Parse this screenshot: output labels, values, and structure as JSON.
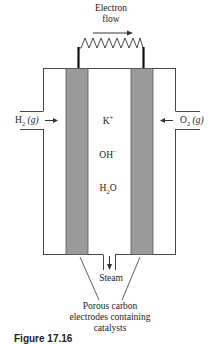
{
  "diagram": {
    "type": "alkaline_fuel_cell",
    "colors": {
      "line": "#333333",
      "electrode_fill": "#9a9a9a",
      "electrode_border": "#555555",
      "wire": "#111111",
      "background": "#ffffff"
    },
    "labels": {
      "electron_flow_line1": "Electron",
      "electron_flow_line2": "flow",
      "left_inlet": {
        "species": "H",
        "sub": "2",
        "state": "(g)"
      },
      "right_inlet": {
        "species": "O",
        "sub": "2",
        "state": "(g)"
      },
      "electrolyte": {
        "cation": {
          "base": "K",
          "sup": "+"
        },
        "anion": {
          "base": "OH",
          "sup": "−"
        },
        "water": {
          "pre": "H",
          "sub": "2",
          "post": "O"
        }
      },
      "outlet": "Steam",
      "electrodes_line1": "Porous carbon",
      "electrodes_line2": "electrodes containing",
      "electrodes_line3": "catalysts"
    },
    "caption": "Figure 17.16"
  }
}
